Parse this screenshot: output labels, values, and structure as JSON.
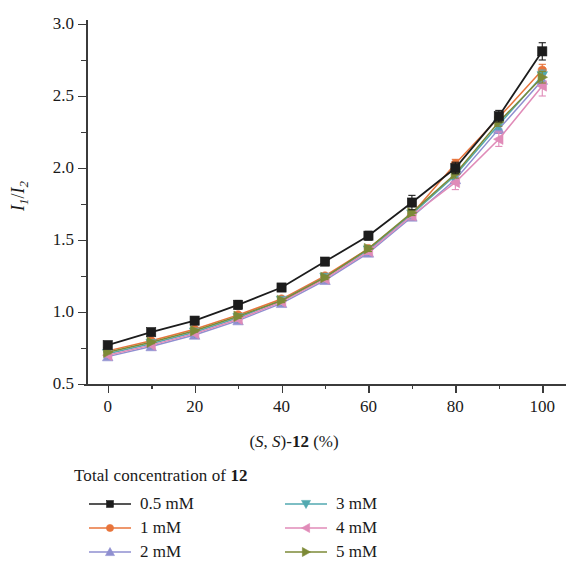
{
  "chart_data": {
    "type": "line",
    "title": "",
    "xlabel": "(S, S)-12 (%)",
    "ylabel": "I1/I2",
    "xlim": [
      -5,
      105
    ],
    "ylim": [
      0.5,
      3.0
    ],
    "grid": false,
    "legend_position": "below-plot",
    "x": [
      0,
      10,
      20,
      30,
      40,
      50,
      60,
      70,
      80,
      90,
      100
    ],
    "x_ticks": [
      "0",
      "20",
      "40",
      "60",
      "80",
      "100"
    ],
    "x_tick_values": [
      0,
      20,
      40,
      60,
      80,
      100
    ],
    "x_minor_tick_values": [
      10,
      30,
      50,
      70,
      90
    ],
    "y_ticks": [
      "0.5",
      "1.0",
      "1.5",
      "2.0",
      "2.5",
      "3.0"
    ],
    "y_tick_values": [
      0.5,
      1.0,
      1.5,
      2.0,
      2.5,
      3.0
    ],
    "y_minor_tick_values": [
      0.75,
      1.25,
      1.75,
      2.25,
      2.75
    ],
    "series": [
      {
        "name": "0.5 mM",
        "color": "#1c1c1c",
        "marker": "square",
        "values": [
          0.77,
          0.86,
          0.94,
          1.05,
          1.17,
          1.35,
          1.53,
          1.76,
          2.0,
          2.36,
          2.81
        ],
        "errors": [
          0.015,
          0.015,
          0.015,
          0.03,
          0.02,
          0.02,
          0.03,
          0.05,
          0.04,
          0.04,
          0.06
        ]
      },
      {
        "name": "1 mM",
        "color": "#e8743b",
        "marker": "circle",
        "values": [
          0.73,
          0.8,
          0.88,
          0.98,
          1.09,
          1.25,
          1.44,
          1.68,
          2.03,
          2.35,
          2.68
        ],
        "errors": [
          0.01,
          0.01,
          0.01,
          0.015,
          0.015,
          0.015,
          0.02,
          0.02,
          0.03,
          0.03,
          0.04
        ]
      },
      {
        "name": "2 mM",
        "color": "#8f8fd0",
        "marker": "triangle-up",
        "values": [
          0.69,
          0.76,
          0.84,
          0.94,
          1.06,
          1.22,
          1.41,
          1.66,
          1.92,
          2.27,
          2.61
        ],
        "errors": [
          0.01,
          0.01,
          0.01,
          0.015,
          0.015,
          0.015,
          0.02,
          0.02,
          0.03,
          0.03,
          0.04
        ]
      },
      {
        "name": "3 mM",
        "color": "#52a9b0",
        "marker": "triangle-down",
        "values": [
          0.71,
          0.78,
          0.86,
          0.96,
          1.08,
          1.24,
          1.43,
          1.68,
          1.95,
          2.3,
          2.64
        ],
        "errors": [
          0.01,
          0.01,
          0.01,
          0.015,
          0.015,
          0.015,
          0.02,
          0.02,
          0.03,
          0.03,
          0.04
        ]
      },
      {
        "name": "4 mM",
        "color": "#e08bb8",
        "marker": "triangle-left",
        "values": [
          0.7,
          0.77,
          0.85,
          0.95,
          1.07,
          1.23,
          1.42,
          1.67,
          1.9,
          2.2,
          2.57
        ],
        "errors": [
          0.01,
          0.01,
          0.01,
          0.015,
          0.015,
          0.02,
          0.02,
          0.03,
          0.05,
          0.05,
          0.07
        ]
      },
      {
        "name": "5 mM",
        "color": "#7d8a37",
        "marker": "triangle-right",
        "values": [
          0.72,
          0.79,
          0.87,
          0.97,
          1.08,
          1.24,
          1.44,
          1.69,
          1.96,
          2.32,
          2.63
        ],
        "errors": [
          0.01,
          0.01,
          0.01,
          0.015,
          0.015,
          0.015,
          0.02,
          0.02,
          0.03,
          0.03,
          0.04
        ]
      }
    ]
  },
  "legend": {
    "title_prefix": "Total concentration of ",
    "title_bold": "12",
    "items": [
      {
        "label": "0.5 mM"
      },
      {
        "label": "3 mM"
      },
      {
        "label": "1 mM"
      },
      {
        "label": "4 mM"
      },
      {
        "label": "2 mM"
      },
      {
        "label": "5 mM"
      }
    ]
  },
  "axis_titles": {
    "x_open": "(",
    "x_s1": "S",
    "x_comma": ", ",
    "x_s2": "S",
    "x_dash": ")-",
    "x_bold": "12",
    "x_percent": " (%)",
    "y_i": "I",
    "y_sub1": "1",
    "y_slash": "/",
    "y_i2": "I",
    "y_sub2": "2"
  }
}
